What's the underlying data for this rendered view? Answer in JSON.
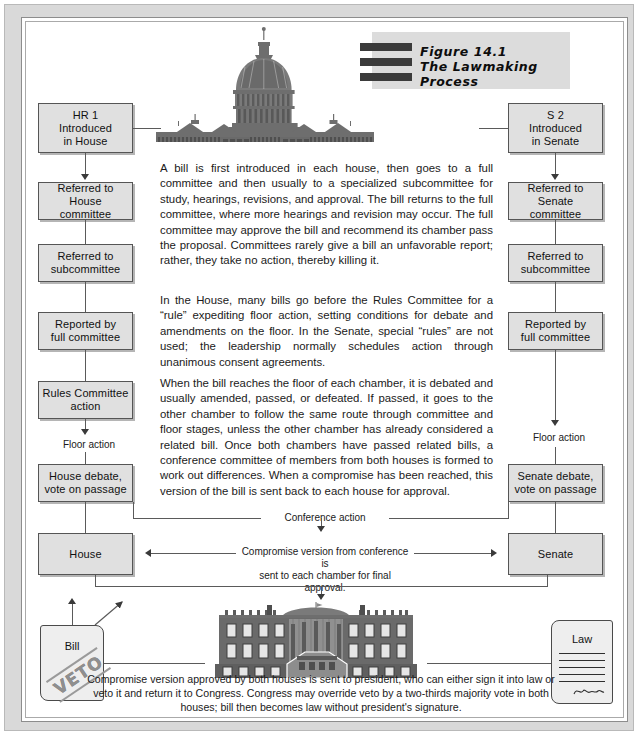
{
  "figure": {
    "number": "Figure 14.1",
    "title": "The Lawmaking Process"
  },
  "illustrations": {
    "capitol": "us-capitol-building",
    "white_house": "white-house-building"
  },
  "house_track": {
    "boxes": [
      {
        "label": "HR 1\nIntroduced\nin House",
        "name": "hr1-introduced-in-house"
      },
      {
        "label": "Referred to\nHouse committee",
        "name": "referred-to-house-committee"
      },
      {
        "label": "Referred to\nsubcommittee",
        "name": "house-referred-to-subcommittee"
      },
      {
        "label": "Reported by\nfull committee",
        "name": "house-reported-by-full-committee"
      },
      {
        "label": "Rules Committee\naction",
        "name": "rules-committee-action"
      },
      {
        "label": "House debate,\nvote on passage",
        "name": "house-debate-vote-on-passage"
      },
      {
        "label": "House",
        "name": "house-final"
      }
    ],
    "floor_action_label": "Floor action"
  },
  "senate_track": {
    "boxes": [
      {
        "label": "S 2\nIntroduced\nin Senate",
        "name": "s2-introduced-in-senate"
      },
      {
        "label": "Referred to\nSenate committee",
        "name": "referred-to-senate-committee"
      },
      {
        "label": "Referred to\nsubcommittee",
        "name": "senate-referred-to-subcommittee"
      },
      {
        "label": "Reported by\nfull committee",
        "name": "senate-reported-by-full-committee"
      },
      {
        "label": "Senate debate,\nvote on passage",
        "name": "senate-debate-vote-on-passage"
      },
      {
        "label": "Senate",
        "name": "senate-final"
      }
    ],
    "floor_action_label": "Floor action"
  },
  "connectors": {
    "conference_action": "Conference action",
    "compromise_version": "Compromise version from conference is\nsent to each chamber for final approval."
  },
  "body": {
    "paragraphs": [
      "A bill is first introduced in each house, then goes to a full committee and then usually to a specialized subcommittee for study, hearings, revisions, and approval. The bill returns to the full committee, where more hearings and revision may occur. The full committee may approve the bill and recommend its chamber pass the proposal. Committees rarely give a bill an unfavorable report; rather, they take no action, thereby killing it.",
      "In the House, many bills go before the Rules Committee for a “rule” expediting floor action, setting conditions for debate and amendments on the floor. In the Senate, special “rules” are not used; the leadership normally schedules action through unanimous consent agreements.",
      "When the bill reaches the floor of each chamber, it is debated and usually amended, passed, or defeated. If passed, it goes to the other chamber to follow the same route through committee and floor stages, unless the other chamber has already considered a related bill. Once both chambers have passed related bills, a conference committee of members from both houses is formed to work out differences. When a compromise has been reached, this version of the bill is sent back to each house for approval."
    ]
  },
  "documents": {
    "bill": {
      "title": "Bill",
      "stamp": "VETO"
    },
    "law": {
      "title": "Law",
      "signature": "presidential-signature"
    }
  },
  "caption": "Compromise version approved by both houses is sent to president, who can either sign it into law or veto it and return it to Congress. Congress may override veto by a two-thirds majority vote in both houses; bill then becomes law without president's signature.",
  "colors": {
    "box_fill": "#e0e0e0",
    "box_border": "#555555",
    "frame": "#d9d9d9",
    "line": "#5a5a5a",
    "banner": "#dcdcdc",
    "building": "#6e6e6e"
  }
}
